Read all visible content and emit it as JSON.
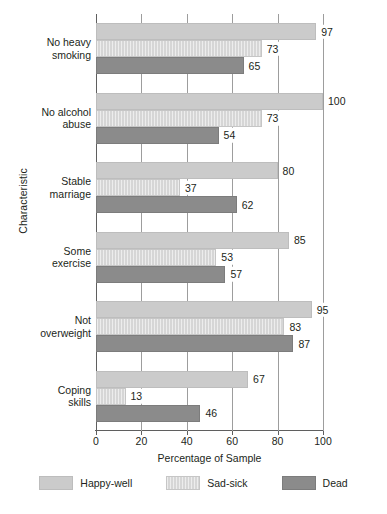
{
  "chart_data": {
    "type": "bar",
    "orientation": "horizontal",
    "title": "",
    "xlabel": "Percentage of Sample",
    "ylabel": "Characteristic",
    "xlim": [
      0,
      100
    ],
    "xticks": [
      0,
      20,
      40,
      60,
      80,
      100
    ],
    "xtick_labels": [
      "0",
      "20",
      "40",
      "60",
      "80",
      "100"
    ],
    "grid": true,
    "grid_axis": "x",
    "legend_position": "bottom",
    "categories": [
      "No heavy smoking",
      "No alcohol abuse",
      "Stable marriage",
      "Some exercise",
      "Not overweight",
      "Coping skills"
    ],
    "category_lines": [
      [
        "No heavy",
        "smoking"
      ],
      [
        "No alcohol",
        "abuse"
      ],
      [
        "Stable",
        "marriage"
      ],
      [
        "Some",
        "exercise"
      ],
      [
        "Not",
        "overweight"
      ],
      [
        "Coping",
        "skills"
      ]
    ],
    "series": [
      {
        "name": "Happy-well",
        "color": "#cbcbcb",
        "values": [
          97,
          100,
          80,
          85,
          95,
          67
        ]
      },
      {
        "name": "Sad-sick",
        "color": "#d6d6d6",
        "values": [
          73,
          73,
          37,
          53,
          83,
          13
        ]
      },
      {
        "name": "Dead",
        "color": "#8b8b8b",
        "values": [
          65,
          54,
          62,
          57,
          87,
          46
        ]
      }
    ]
  },
  "legend": {
    "items": [
      {
        "label": "Happy-well",
        "swatch": "happy"
      },
      {
        "label": "Sad-sick",
        "swatch": "sad"
      },
      {
        "label": "Dead",
        "swatch": "dead"
      }
    ]
  }
}
